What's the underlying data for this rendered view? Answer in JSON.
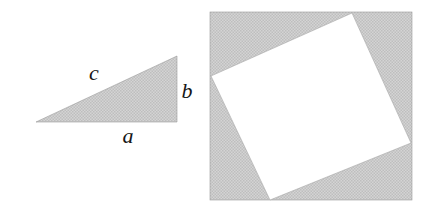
{
  "figure": {
    "background_color": "#ffffff",
    "fill_color": "#c9c9c9",
    "stipple_dark": "#b4b4b4",
    "stipple_light": "#dedede",
    "label_color": "#161616",
    "panels": [
      {
        "name": "right-triangle-panel",
        "description": "Shaded right triangle with legs a and b and hypotenuse c",
        "shape": "triangle",
        "vertices": [
          [
            36,
            122
          ],
          [
            177,
            122
          ],
          [
            177,
            56
          ]
        ],
        "labels": [
          {
            "id": "leg-a",
            "text": "a",
            "x": 128,
            "y": 143
          },
          {
            "id": "leg-b",
            "text": "b",
            "x": 187,
            "y": 98
          },
          {
            "id": "hypotenuse-c",
            "text": "c",
            "x": 94,
            "y": 80
          }
        ]
      },
      {
        "name": "tilted-square-panel",
        "description": "Large shaded square containing an inscribed white tilted square",
        "outer_square": {
          "name": "outer-square",
          "x": 210,
          "y": 12,
          "width": 202,
          "height": 188,
          "fill": "#c9c9c9"
        },
        "inner_square": {
          "name": "inner-tilted-square",
          "fill": "#ffffff",
          "vertices": [
            [
              352,
              13
            ],
            [
              411,
              143
            ],
            [
              270,
              200
            ],
            [
              211,
              76
            ]
          ]
        }
      }
    ]
  }
}
